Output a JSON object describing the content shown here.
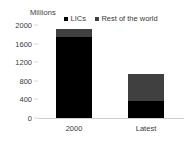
{
  "axis": {
    "unit_label": "Millions",
    "y_ticks": [
      "2000",
      "1600",
      "1200",
      "800",
      "400",
      "0"
    ]
  },
  "legend": {
    "items": [
      {
        "label": "LICs",
        "color": "#000000"
      },
      {
        "label": "Rest of the world",
        "color": "#404040"
      }
    ]
  },
  "chart_data": {
    "type": "bar",
    "title": "",
    "xlabel": "",
    "ylabel": "Millions",
    "ylim": [
      0,
      2000
    ],
    "yticks": [
      0,
      400,
      800,
      1200,
      1600,
      2000
    ],
    "grid": false,
    "legend_position": "top",
    "stacked": true,
    "categories": [
      "2000",
      "Latest"
    ],
    "series": [
      {
        "name": "LICs",
        "color": "#000000",
        "values": [
          1750,
          370
        ]
      },
      {
        "name": "Rest of the world",
        "color": "#404040",
        "values": [
          175,
          580
        ]
      }
    ],
    "totals": [
      1925,
      950
    ]
  }
}
